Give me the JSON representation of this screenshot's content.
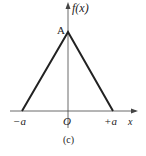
{
  "figure": {
    "caption": "(c)",
    "y_axis_label": "f(x)",
    "x_axis_label": "x",
    "peak_label": "A",
    "origin_label": "O",
    "left_tick_label": "−a",
    "right_tick_label": "+a",
    "shape": "triangular pulse",
    "points": [
      {
        "x": "-a",
        "y": "0"
      },
      {
        "x": "0",
        "y": "A"
      },
      {
        "x": "+a",
        "y": "0"
      }
    ],
    "line_color": "#222222"
  }
}
